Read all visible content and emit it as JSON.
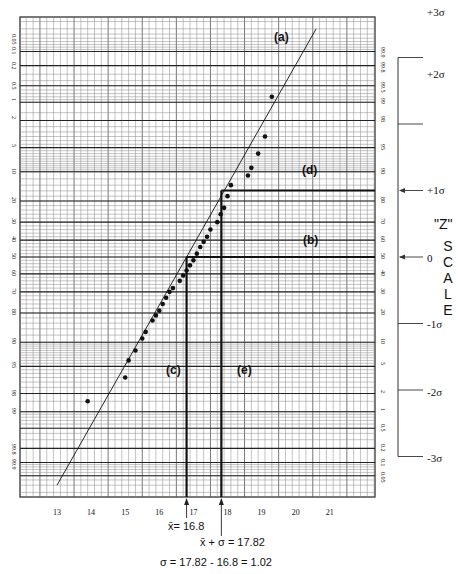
{
  "chart_data": {
    "type": "scatter",
    "title": "",
    "subtitle": "Normal probability plot",
    "xlabel": "",
    "ylabel": "Cumulative percent",
    "xlim": [
      12.1,
      22.5
    ],
    "x_ticks": [
      "13",
      "14",
      "15",
      "16",
      "17",
      "18",
      "19",
      "20",
      "21"
    ],
    "y_ticks_left": [
      "99.99",
      "99.9",
      "99.8",
      "99",
      "98",
      "95",
      "90",
      "80",
      "70",
      "60",
      "50",
      "40",
      "30",
      "20",
      "10",
      "5",
      "2",
      "1",
      "0.5",
      "0.2",
      "0.1",
      "0.05",
      "0.01"
    ],
    "y_ticks_left_top_to_bottom": [
      "0.01",
      "0.05",
      "0.1",
      "0.2",
      "0.5",
      "1",
      "2",
      "5",
      "10",
      "20",
      "30",
      "40",
      "50",
      "60",
      "70",
      "80",
      "90",
      "95",
      "98",
      "99",
      "99.8",
      "99.9",
      "99.99"
    ],
    "y_ticks_right_top_to_bottom": [
      "99.99",
      "99.9",
      "99.8",
      "99.5",
      "99",
      "98",
      "95",
      "90",
      "80",
      "70",
      "60",
      "50",
      "40",
      "30",
      "20",
      "10",
      "5",
      "2",
      "1",
      "0.5",
      "0.2",
      "0.1",
      "0.05",
      "0.01"
    ],
    "grid": true,
    "series": [
      {
        "name": "observations",
        "points": [
          {
            "x": 13.9,
            "y": 1.5
          },
          {
            "x": 15.0,
            "y": 3.5
          },
          {
            "x": 15.1,
            "y": 6
          },
          {
            "x": 15.3,
            "y": 8
          },
          {
            "x": 15.5,
            "y": 11
          },
          {
            "x": 15.6,
            "y": 13
          },
          {
            "x": 15.8,
            "y": 17
          },
          {
            "x": 15.9,
            "y": 19
          },
          {
            "x": 16.0,
            "y": 21
          },
          {
            "x": 16.1,
            "y": 24
          },
          {
            "x": 16.2,
            "y": 27
          },
          {
            "x": 16.3,
            "y": 30
          },
          {
            "x": 16.4,
            "y": 32
          },
          {
            "x": 16.6,
            "y": 36
          },
          {
            "x": 16.7,
            "y": 39
          },
          {
            "x": 16.8,
            "y": 42
          },
          {
            "x": 16.9,
            "y": 45
          },
          {
            "x": 17.0,
            "y": 48
          },
          {
            "x": 17.1,
            "y": 52
          },
          {
            "x": 17.2,
            "y": 56
          },
          {
            "x": 17.3,
            "y": 59
          },
          {
            "x": 17.4,
            "y": 62
          },
          {
            "x": 17.5,
            "y": 66
          },
          {
            "x": 17.7,
            "y": 70
          },
          {
            "x": 17.8,
            "y": 74
          },
          {
            "x": 17.9,
            "y": 77
          },
          {
            "x": 18.0,
            "y": 82
          },
          {
            "x": 18.1,
            "y": 86
          },
          {
            "x": 18.6,
            "y": 89
          },
          {
            "x": 18.7,
            "y": 91
          },
          {
            "x": 18.9,
            "y": 94
          },
          {
            "x": 19.1,
            "y": 96.5
          },
          {
            "x": 19.3,
            "y": 99.2
          }
        ]
      },
      {
        "name": "fitted line (a)",
        "line": [
          {
            "x": 13.0,
            "y": 0.03
          },
          {
            "x": 20.6,
            "y": 99.97
          }
        ]
      }
    ],
    "reference_lines": [
      {
        "label": "(b)",
        "type": "horizontal",
        "y": 50
      },
      {
        "label": "(d)",
        "type": "horizontal",
        "y": 84.13
      },
      {
        "label": "(c)",
        "type": "vertical",
        "x": 16.8
      },
      {
        "label": "(e)",
        "type": "vertical",
        "x": 17.82
      }
    ],
    "annotations": [
      "(a)",
      "(b)",
      "(c)",
      "(d)",
      "(e)"
    ],
    "z_scale": {
      "title": "\"Z\"",
      "title2": "SCALE",
      "ticks": [
        "+3σ",
        "+2σ",
        "+1σ",
        "0",
        "-1σ",
        "-2σ",
        "-3σ"
      ]
    },
    "footer": {
      "mean": "x̄= 16.8",
      "mean_plus_sigma": "x̄ + σ = 17.82",
      "sigma": "σ = 17.82 - 16.8 = 1.02"
    }
  },
  "labels": {
    "a": "(a)",
    "b": "(b)",
    "c": "(c)",
    "d": "(d)",
    "e": "(e)",
    "z_quote": "\"Z\"",
    "z_letters": [
      "S",
      "C",
      "A",
      "L",
      "E"
    ],
    "z_p3": "+3σ",
    "z_p2": "+2σ",
    "z_p1": "+1σ",
    "z_0": "0",
    "z_m1": "-1σ",
    "z_m2": "-2σ",
    "z_m3": "-3σ"
  }
}
